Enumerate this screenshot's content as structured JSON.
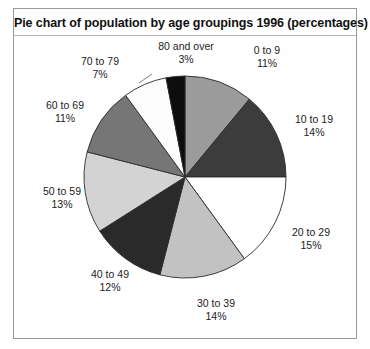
{
  "frame": {
    "border_color": "#9a9a9a",
    "background": "#ffffff"
  },
  "chart_data": {
    "type": "pie",
    "title": "Pie chart of population by age groupings 1996 (percentages)",
    "xlabel": "",
    "ylabel": "",
    "legend_position": "none",
    "grid": false,
    "start_angle_deg": 0,
    "direction": "clockwise",
    "units": "percent",
    "total": 100,
    "categories": [
      "0 to 9",
      "10 to 19",
      "20 to 29",
      "30 to 39",
      "40 to 49",
      "50 to 59",
      "60 to 69",
      "70 to 79",
      "80 and over"
    ],
    "values": [
      11,
      14,
      15,
      14,
      12,
      13,
      11,
      7,
      3
    ],
    "slice_colors": [
      "#9b9b9b",
      "#3c3c3c",
      "#ffffff",
      "#c2c2c2",
      "#2a2a2a",
      "#d3d3d3",
      "#767676",
      "#fcfcfc",
      "#0d0d0d"
    ],
    "slices": [
      {
        "label": "0 to 9",
        "percent_text": "11%",
        "value": 11,
        "color": "#9b9b9b"
      },
      {
        "label": "10 to 19",
        "percent_text": "14%",
        "value": 14,
        "color": "#3c3c3c"
      },
      {
        "label": "20 to 29",
        "percent_text": "15%",
        "value": 15,
        "color": "#ffffff"
      },
      {
        "label": "30 to 39",
        "percent_text": "14%",
        "value": 14,
        "color": "#c2c2c2"
      },
      {
        "label": "40 to 49",
        "percent_text": "12%",
        "value": 12,
        "color": "#2a2a2a"
      },
      {
        "label": "50 to 59",
        "percent_text": "13%",
        "value": 13,
        "color": "#d3d3d3"
      },
      {
        "label": "60 to 69",
        "percent_text": "11%",
        "value": 11,
        "color": "#767676"
      },
      {
        "label": "70 to 79",
        "percent_text": "7%",
        "value": 7,
        "color": "#fcfcfc"
      },
      {
        "label": "80 and over",
        "percent_text": "3%",
        "value": 3,
        "color": "#0d0d0d"
      }
    ]
  },
  "labels": {
    "s0_name": "0 to 9",
    "s0_pct": "11%",
    "s1_name": "10 to 19",
    "s1_pct": "14%",
    "s2_name": "20 to 29",
    "s2_pct": "15%",
    "s3_name": "30 to 39",
    "s3_pct": "14%",
    "s4_name": "40 to 49",
    "s4_pct": "12%",
    "s5_name": "50 to 59",
    "s5_pct": "13%",
    "s6_name": "60 to 69",
    "s6_pct": "11%",
    "s7_name": "70 to 79",
    "s7_pct": "7%",
    "s8_name": "80 and over",
    "s8_pct": "3%"
  }
}
